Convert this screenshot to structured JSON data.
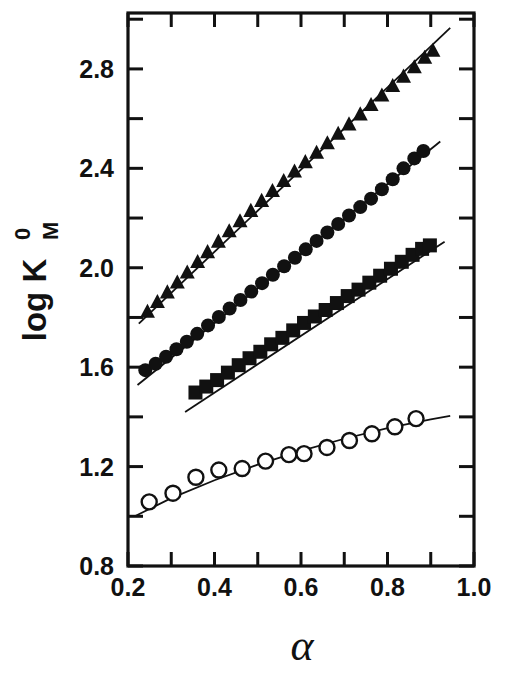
{
  "figure": {
    "background_color": "#ffffff",
    "ink_color": "#111111",
    "width": 509,
    "height": 676
  },
  "axes": {
    "x_title": "α",
    "y_title_main": "log K",
    "y_title_sub": "M",
    "y_title_sup": "0",
    "x_tick_labels": [
      "0.2",
      "0.4",
      "0.6",
      "0.8",
      "1.0"
    ],
    "y_tick_labels": [
      "0.8",
      "1.2",
      "1.6",
      "2.0",
      "2.4",
      "2.8"
    ]
  },
  "chart_data": {
    "type": "scatter",
    "title": "",
    "xlabel": "α",
    "ylabel": "log K_M^0",
    "xlim": [
      0.2,
      1.0
    ],
    "ylim": [
      0.8,
      3.025
    ],
    "x_ticks": [
      0.2,
      0.4,
      0.6,
      0.8,
      1.0
    ],
    "x_minor_ticks": [
      0.3,
      0.5,
      0.7,
      0.9
    ],
    "y_ticks": [
      0.8,
      1.2,
      1.6,
      2.0,
      2.4,
      2.8
    ],
    "y_minor_ticks": [
      1.0,
      1.4,
      1.8,
      2.2,
      2.6,
      3.0
    ],
    "grid": false,
    "legend": "none",
    "series": [
      {
        "name": "triangles",
        "marker": "triangle-up-filled",
        "marker_color": "#111111",
        "marker_size": 15,
        "fit_line": {
          "x": [
            0.225,
            0.945
          ],
          "y": [
            1.775,
            2.965
          ]
        },
        "x": [
          0.245,
          0.268,
          0.291,
          0.314,
          0.337,
          0.361,
          0.384,
          0.409,
          0.434,
          0.459,
          0.484,
          0.509,
          0.534,
          0.56,
          0.585,
          0.61,
          0.636,
          0.661,
          0.686,
          0.711,
          0.737,
          0.762,
          0.787,
          0.812,
          0.837,
          0.862,
          0.886,
          0.905
        ],
        "y": [
          1.822,
          1.861,
          1.9,
          1.94,
          1.98,
          2.022,
          2.062,
          2.104,
          2.146,
          2.186,
          2.228,
          2.268,
          2.308,
          2.348,
          2.386,
          2.424,
          2.462,
          2.5,
          2.538,
          2.576,
          2.616,
          2.654,
          2.692,
          2.73,
          2.768,
          2.806,
          2.844,
          2.872
        ]
      },
      {
        "name": "circles-filled",
        "marker": "circle-filled",
        "marker_color": "#111111",
        "marker_size": 14,
        "fit_line": {
          "x": [
            0.222,
            0.922
          ],
          "y": [
            1.528,
            2.508
          ]
        },
        "x": [
          0.24,
          0.264,
          0.288,
          0.312,
          0.336,
          0.36,
          0.385,
          0.41,
          0.435,
          0.46,
          0.485,
          0.51,
          0.535,
          0.561,
          0.586,
          0.611,
          0.636,
          0.661,
          0.686,
          0.711,
          0.737,
          0.762,
          0.787,
          0.812,
          0.837,
          0.862,
          0.883
        ],
        "y": [
          1.588,
          1.614,
          1.642,
          1.672,
          1.702,
          1.734,
          1.768,
          1.802,
          1.836,
          1.87,
          1.904,
          1.938,
          1.972,
          2.006,
          2.04,
          2.074,
          2.108,
          2.142,
          2.176,
          2.21,
          2.244,
          2.278,
          2.316,
          2.356,
          2.4,
          2.44,
          2.47
        ]
      },
      {
        "name": "squares-filled",
        "marker": "square-filled",
        "marker_color": "#111111",
        "marker_size": 14,
        "fit_line": {
          "x": [
            0.332,
            0.932
          ],
          "y": [
            1.42,
            2.105
          ]
        },
        "x": [
          0.356,
          0.381,
          0.406,
          0.431,
          0.456,
          0.481,
          0.506,
          0.531,
          0.557,
          0.582,
          0.607,
          0.632,
          0.657,
          0.683,
          0.708,
          0.733,
          0.758,
          0.783,
          0.808,
          0.833,
          0.858,
          0.88,
          0.898
        ],
        "y": [
          1.498,
          1.522,
          1.548,
          1.578,
          1.608,
          1.636,
          1.662,
          1.692,
          1.718,
          1.748,
          1.778,
          1.804,
          1.83,
          1.858,
          1.886,
          1.912,
          1.94,
          1.968,
          1.996,
          2.024,
          2.052,
          2.076,
          2.09
        ]
      },
      {
        "name": "circles-open",
        "marker": "circle-open",
        "marker_color": "#111111",
        "marker_size": 15,
        "fit_line_curved": {
          "x": [
            0.218,
            0.3,
            0.4,
            0.5,
            0.6,
            0.7,
            0.8,
            0.9,
            0.945
          ],
          "y": [
            1.002,
            1.073,
            1.145,
            1.208,
            1.263,
            1.312,
            1.355,
            1.39,
            1.404
          ]
        },
        "x": [
          0.249,
          0.304,
          0.357,
          0.41,
          0.464,
          0.518,
          0.572,
          0.607,
          0.66,
          0.712,
          0.764,
          0.817,
          0.866
        ],
        "y": [
          1.058,
          1.093,
          1.157,
          1.186,
          1.192,
          1.222,
          1.248,
          1.252,
          1.277,
          1.305,
          1.332,
          1.36,
          1.393
        ]
      }
    ]
  }
}
